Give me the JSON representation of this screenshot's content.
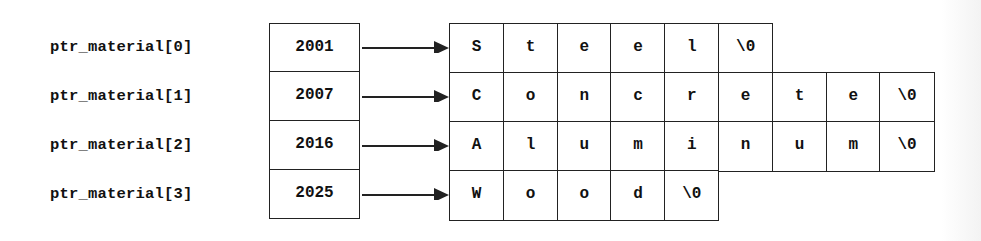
{
  "diagram": {
    "rows": [
      {
        "label": "ptr_material[0]",
        "address": "2001",
        "chars": [
          "S",
          "t",
          "e",
          "e",
          "l",
          "\\0"
        ]
      },
      {
        "label": "ptr_material[1]",
        "address": "2007",
        "chars": [
          "C",
          "o",
          "n",
          "c",
          "r",
          "e",
          "t",
          "e",
          "\\0"
        ]
      },
      {
        "label": "ptr_material[2]",
        "address": "2016",
        "chars": [
          "A",
          "l",
          "u",
          "m",
          "i",
          "n",
          "u",
          "m",
          "\\0"
        ]
      },
      {
        "label": "ptr_material[3]",
        "address": "2025",
        "chars": [
          "W",
          "o",
          "o",
          "d",
          "\\0"
        ]
      }
    ],
    "colors": {
      "line": "#222222",
      "text": "#111111",
      "background": "#ffffff"
    }
  }
}
